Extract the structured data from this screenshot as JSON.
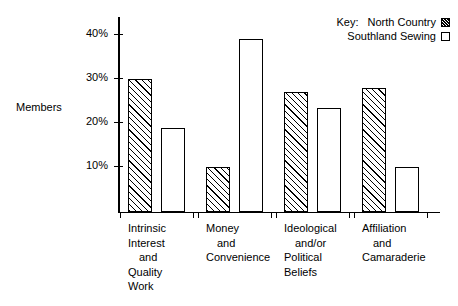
{
  "chart_data": {
    "type": "bar",
    "title": "",
    "xlabel": "",
    "ylabel": "Members",
    "ylim": [
      0,
      44
    ],
    "grid": false,
    "legend_position": "top-right",
    "y_ticks": [
      "10%",
      "20%",
      "30%",
      "40%"
    ],
    "y_tick_values": [
      10,
      20,
      30,
      40
    ],
    "categories": [
      "Intrinsic Interest and Quality Work",
      "Money and Convenience",
      "Ideological and/or Political Beliefs",
      "Affiliation and Camaraderie"
    ],
    "series": [
      {
        "name": "North Country",
        "values": [
          30,
          10,
          27,
          28
        ],
        "fill": "hatched"
      },
      {
        "name": "Southland Sewing",
        "values": [
          19,
          39,
          23.5,
          10
        ],
        "fill": "plain"
      }
    ]
  },
  "legend": {
    "key_word": "Key:",
    "entries": [
      {
        "label": "North Country",
        "swatch": "hatched-swatch"
      },
      {
        "label": "Southland Sewing",
        "swatch": "plain-swatch"
      }
    ]
  },
  "axis": {
    "y_label": "Members"
  },
  "category_labels": [
    {
      "lines": [
        "Intrinsic",
        "Interest",
        "and",
        "Quality",
        "Work"
      ],
      "indent": [
        false,
        false,
        true,
        false,
        false
      ]
    },
    {
      "lines": [
        "Money",
        "and",
        "Convenience"
      ],
      "indent": [
        false,
        true,
        false
      ]
    },
    {
      "lines": [
        "Ideological",
        "and/or",
        "Political",
        "Beliefs"
      ],
      "indent": [
        false,
        true,
        false,
        false
      ]
    },
    {
      "lines": [
        "Affiliation",
        "and",
        "Camaraderie"
      ],
      "indent": [
        false,
        true,
        false
      ]
    }
  ]
}
